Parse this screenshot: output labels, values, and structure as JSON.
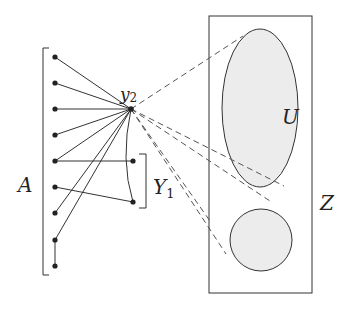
{
  "diagram": {
    "labels": {
      "A": "A",
      "y2_main": "y",
      "y2_sub": "2",
      "Y1_main": "Y",
      "Y1_sub": "1",
      "U": "U",
      "Z": "Z"
    },
    "colors": {
      "stroke": "#333333",
      "fill_region": "#ececec",
      "dashed": "#555555"
    },
    "set_A": {
      "name": "A",
      "vertex_count": 9,
      "vertices_y": [
        57,
        83,
        109,
        135,
        161,
        187,
        213,
        240,
        266
      ],
      "vertex_x": 55
    },
    "vertex_y2": {
      "name": "y2",
      "x": 131,
      "y": 109
    },
    "set_Y1": {
      "name": "Y1",
      "vertices": [
        {
          "x": 133,
          "y": 161
        },
        {
          "x": 133,
          "y": 202
        }
      ]
    },
    "region_Z": {
      "name": "Z",
      "shape": "rectangle",
      "x": 209,
      "y": 16,
      "width": 103,
      "height": 277
    },
    "region_U": {
      "name": "U",
      "shape": "ellipse",
      "cx": 260,
      "cy": 108,
      "rx": 38,
      "ry": 79
    },
    "region_disk": {
      "shape": "circle",
      "cx": 261,
      "cy": 240,
      "r": 31
    },
    "edges": {
      "A_to_y2": [
        0,
        1,
        2,
        3,
        4,
        6,
        7
      ],
      "A_to_Y1": [
        [
          4,
          0
        ],
        [
          5,
          1
        ]
      ],
      "A_internal": [
        [
          7,
          8
        ]
      ],
      "y2_to_Y1_curve": "y2 to lower Y1 vertex (curved)"
    },
    "dashed_lines": "from y2 to top of U, to lower-right of U (two lines), and to circle (two lines)"
  }
}
